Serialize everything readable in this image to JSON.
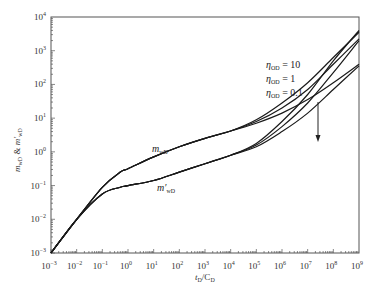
{
  "chart_data": {
    "type": "line",
    "title": "",
    "xlabel": "tD/CD",
    "ylabel": "mwD & m'wD",
    "xscale": "log",
    "yscale": "log",
    "xlim": [
      0.001,
      1000000000
    ],
    "ylim": [
      0.001,
      10000
    ],
    "grid": false,
    "x_ticks": [
      "10^-3",
      "10^-2",
      "10^-1",
      "10^0",
      "10^1",
      "10^2",
      "10^3",
      "10^4",
      "10^5",
      "10^6",
      "10^7",
      "10^8",
      "10^9"
    ],
    "y_ticks": [
      "10^-3",
      "10^-2",
      "10^-1",
      "10^0",
      "10^1",
      "10^2",
      "10^3",
      "10^4"
    ],
    "series": [
      {
        "name": "mwD (ηOD=10)",
        "x_log": [
          -3,
          -2,
          -1,
          -0.3,
          0,
          1,
          2,
          3,
          4,
          5,
          6,
          7,
          8,
          9
        ],
        "y_log": [
          -3,
          -2,
          -1.05,
          -0.6,
          -0.5,
          -0.15,
          0.15,
          0.4,
          0.62,
          0.95,
          1.45,
          2.05,
          2.8,
          3.55
        ]
      },
      {
        "name": "mwD (ηOD=1)",
        "x_log": [
          -3,
          -2,
          -1,
          -0.3,
          0,
          1,
          2,
          3,
          4,
          5,
          6,
          7,
          8,
          9
        ],
        "y_log": [
          -3,
          -2,
          -1.05,
          -0.6,
          -0.5,
          -0.15,
          0.15,
          0.4,
          0.62,
          0.9,
          1.3,
          1.85,
          2.6,
          3.35
        ]
      },
      {
        "name": "mwD (ηOD=0.1)",
        "x_log": [
          -3,
          -2,
          -1,
          -0.3,
          0,
          1,
          2,
          3,
          4,
          5,
          6,
          7,
          8,
          9
        ],
        "y_log": [
          -3,
          -2,
          -1.05,
          -0.6,
          -0.5,
          -0.15,
          0.15,
          0.4,
          0.62,
          0.85,
          1.15,
          1.55,
          2.05,
          2.6
        ]
      },
      {
        "name": "m'wD (ηOD=10)",
        "x_log": [
          -3,
          -2,
          -1,
          -0.3,
          0,
          1,
          2,
          3,
          4,
          5,
          6,
          7,
          8,
          9
        ],
        "y_log": [
          -3,
          -2,
          -1.25,
          -1.05,
          -1.0,
          -0.85,
          -0.6,
          -0.35,
          -0.1,
          0.25,
          0.9,
          1.7,
          2.7,
          3.6
        ]
      },
      {
        "name": "m'wD (ηOD=1)",
        "x_log": [
          -3,
          -2,
          -1,
          -0.3,
          0,
          1,
          2,
          3,
          4,
          5,
          6,
          7,
          8,
          9
        ],
        "y_log": [
          -3,
          -2,
          -1.25,
          -1.05,
          -1.0,
          -0.85,
          -0.6,
          -0.35,
          -0.1,
          0.2,
          0.75,
          1.45,
          2.35,
          3.3
        ]
      },
      {
        "name": "m'wD (ηOD=0.1)",
        "x_log": [
          -3,
          -2,
          -1,
          -0.3,
          0,
          1,
          2,
          3,
          4,
          5,
          6,
          7,
          8,
          9
        ],
        "y_log": [
          -3,
          -2,
          -1.25,
          -1.05,
          -1.0,
          -0.85,
          -0.6,
          -0.35,
          -0.1,
          0.15,
          0.6,
          1.15,
          1.85,
          2.55
        ]
      }
    ],
    "annotations": [
      {
        "text": "mwD",
        "x_log": 1.3,
        "y_log": 0.15
      },
      {
        "text": "m'wD",
        "x_log": 1.3,
        "y_log": -1.05
      },
      {
        "text": "ηOD = 10",
        "x_log": 5.5,
        "y_log": 2.5
      },
      {
        "text": "ηOD = 1",
        "x_log": 5.5,
        "y_log": 2.05
      },
      {
        "text": "ηOD = 0.1",
        "x_log": 5.5,
        "y_log": 1.65
      },
      {
        "text": "arrow: increasing ηOD direction (downward)",
        "x_log": 7.2,
        "y_log_from": 2.6,
        "y_log_to": 0.65
      }
    ]
  },
  "labels": {
    "ylabel_main": "m",
    "ylabel_sub1": "wD",
    "ylabel_amp": " & ",
    "ylabel_prime": "m′",
    "ylabel_sub2": "wD",
    "xlabel_t": "t",
    "xlabel_sub1": "D",
    "xlabel_slash": "/C",
    "xlabel_sub2": "D",
    "curve_m": "m",
    "curve_m_sub": "wD",
    "curve_mp": "m′",
    "curve_mp_sub": "wD",
    "eta": "η",
    "eta_sub": "OD",
    "eta_10": " = 10",
    "eta_1": " = 1",
    "eta_01": " = 0.1"
  }
}
